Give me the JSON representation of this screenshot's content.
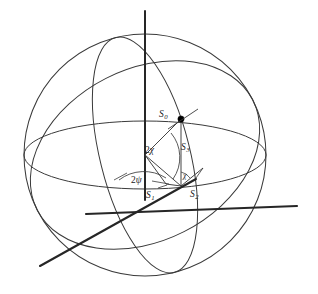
{
  "figure": {
    "kind": "poincare-sphere-diagram",
    "title": "",
    "background_color": "#ffffff",
    "line_color": "#333333",
    "axis_color": "#1a1a1a",
    "point_color": "#000000"
  },
  "sphere": {
    "center_x": 145,
    "center_y": 155,
    "radius": 121,
    "equator_label": "",
    "meridian_label": ""
  },
  "axes": [
    {
      "name": "s3-axis",
      "label": "",
      "from_x": 145,
      "from_y": 11,
      "to_x": 145,
      "to_y": 200
    },
    {
      "name": "s1-axis",
      "label": "",
      "from_x": 40,
      "from_y": 266,
      "to_x": 198,
      "to_y": 178
    },
    {
      "name": "s2-axis",
      "label": "",
      "from_x": 84,
      "from_y": 215,
      "to_x": 297,
      "to_y": 206
    }
  ],
  "labels": {
    "s0": {
      "text": "S",
      "sub": "0",
      "x": 159,
      "y": 112
    },
    "s1": {
      "text": "S",
      "sub": "1",
      "x": 146,
      "y": 191
    },
    "s2": {
      "text": "S",
      "sub": "2",
      "x": 189,
      "y": 190
    },
    "s3": {
      "text": "S",
      "sub": "3",
      "x": 181,
      "y": 143
    },
    "two_chi": {
      "text": "2",
      "greek": "χ",
      "x": 145,
      "y": 146
    },
    "two_psi": {
      "text": "2",
      "greek": "ψ",
      "x": 131,
      "y": 176
    },
    "chi_small": {
      "text": "",
      "greek": "χ",
      "x": 181,
      "y": 179
    }
  },
  "point": {
    "name": "stokes-point",
    "x": 181,
    "y": 119,
    "radius": 3.1
  },
  "vectors": [
    {
      "name": "s0-vector",
      "from_x": 145,
      "from_y": 155,
      "to_x": 181,
      "to_y": 119
    },
    {
      "name": "s3-projection",
      "from_x": 181,
      "from_y": 119,
      "to_x": 181,
      "to_y": 185
    },
    {
      "name": "s1-component",
      "from_x": 145,
      "from_y": 155,
      "to_x": 164,
      "to_y": 184
    },
    {
      "name": "projection-to-plane",
      "from_x": 145,
      "from_y": 155,
      "to_x": 181,
      "to_y": 185
    },
    {
      "name": "s1-foot",
      "from_x": 164,
      "from_y": 184,
      "to_x": 181,
      "to_y": 185
    },
    {
      "name": "s2-component",
      "from_x": 181,
      "from_y": 185,
      "to_x": 200,
      "to_y": 170
    }
  ],
  "leaders": [
    {
      "name": "two-psi-leader",
      "from_x": 128,
      "from_y": 172,
      "to_x": 116,
      "to_y": 178
    },
    {
      "name": "two-psi-leader-right",
      "from_x": 152,
      "from_y": 180,
      "to_x": 168,
      "to_y": 183
    },
    {
      "name": "s1-leader",
      "from_x": 155,
      "from_y": 186,
      "to_x": 166,
      "to_y": 184
    }
  ],
  "meta": {
    "visible_text_items": [
      "S0",
      "S1",
      "S2",
      "S3",
      "2χ",
      "2ψ",
      "χ"
    ]
  }
}
